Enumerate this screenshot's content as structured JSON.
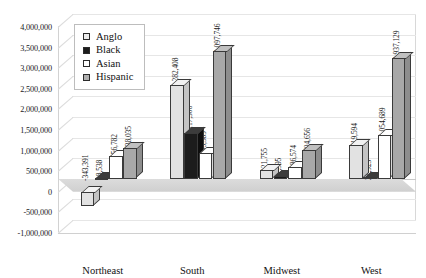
{
  "chart_data": {
    "type": "bar",
    "title": "",
    "subtitle": "",
    "xlabel": "",
    "ylabel": "",
    "categories": [
      "Northeast",
      "South",
      "Midwest",
      "West"
    ],
    "series": [
      {
        "name": "Anglo",
        "values": [
          -343391,
          2282408,
          221755,
          819594
        ],
        "labels": [
          "-343,391",
          "2,282,408",
          "221,755",
          "819,594"
        ],
        "color": "#e2e2e2"
      },
      {
        "name": "Black",
        "values": [
          18538,
          1117306,
          67595,
          21923
        ],
        "labels": [
          "18,538",
          "1,117,306",
          "67,595",
          "21,923"
        ],
        "color": "#1c1c1c"
      },
      {
        "name": "Asian",
        "values": [
          556782,
          635589,
          286574,
          1054689
        ],
        "labels": [
          "556,782",
          "635,589",
          "286,574",
          "1,054,689"
        ],
        "color": "#ffffff"
      },
      {
        "name": "Hispanic",
        "values": [
          738035,
          3097746,
          704656,
          2937129
        ],
        "labels": [
          "738,035",
          "3,097,746",
          "704,656",
          "2,937,129"
        ],
        "color": "#a8a8a8"
      }
    ],
    "ylim": [
      -1000000,
      4000000
    ],
    "ytick_step": 500000,
    "ytick_labels": [
      "4,000,000",
      "3,500,000",
      "3,000,000",
      "2,500,000",
      "2,000,000",
      "1,500,000",
      "1,000,000",
      "500,000",
      "0",
      "-500,000",
      "-1,000,000"
    ],
    "ytick_values": [
      4000000,
      3500000,
      3000000,
      2500000,
      2000000,
      1500000,
      1000000,
      500000,
      0,
      -500000,
      -1000000
    ],
    "grid": true,
    "legend_position": "upper-left",
    "projection": "3d-columns"
  }
}
